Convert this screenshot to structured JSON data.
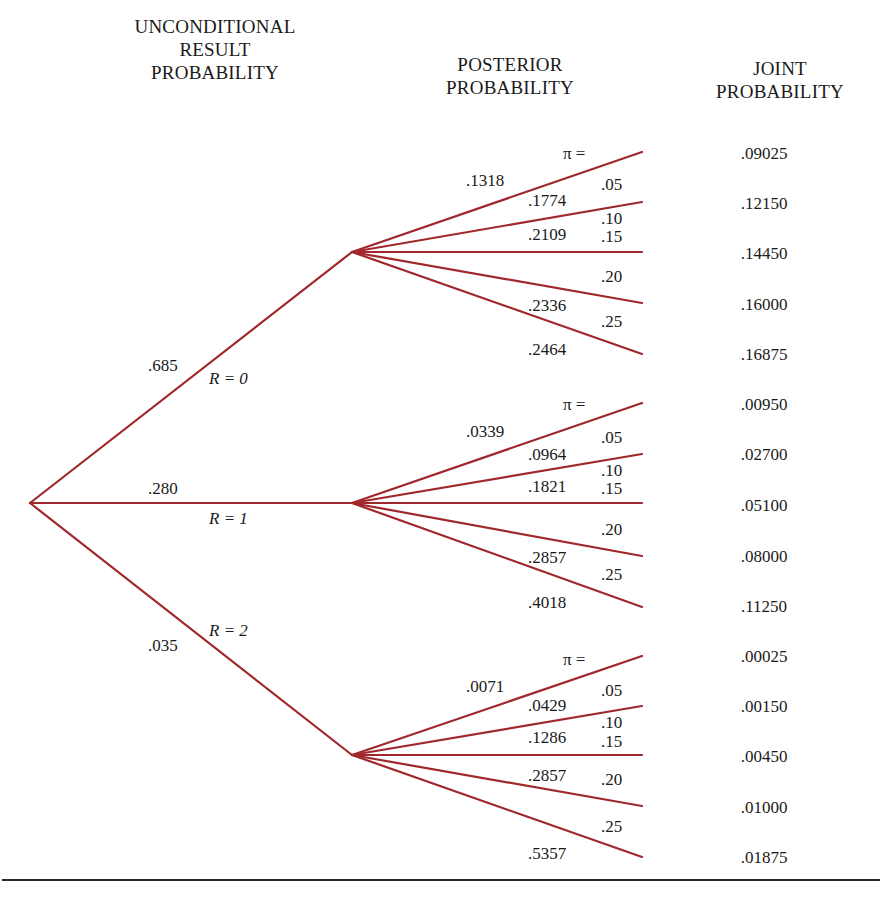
{
  "headers": {
    "unconditional": [
      "UNCONDITIONAL",
      "RESULT",
      "PROBABILITY"
    ],
    "posterior": [
      "POSTERIOR",
      "PROBABILITY"
    ],
    "joint": [
      "JOINT",
      "PROBABILITY"
    ]
  },
  "colors": {
    "branch": "#a0282c",
    "text": "#1a1a1a",
    "rule": "#2a2a2a"
  },
  "pi_label": "π =",
  "pi_values": [
    ".05",
    ".10",
    ".15",
    ".20",
    ".25"
  ],
  "results": [
    {
      "result_label": "R = 0",
      "unconditional_prob": ".685",
      "posterior": [
        ".1318",
        ".1774",
        ".2109",
        ".2336",
        ".2464"
      ],
      "joint": [
        ".09025",
        ".12150",
        ".14450",
        ".16000",
        ".16875"
      ]
    },
    {
      "result_label": "R = 1",
      "unconditional_prob": ".280",
      "posterior": [
        ".0339",
        ".0964",
        ".1821",
        ".2857",
        ".4018"
      ],
      "joint": [
        ".00950",
        ".02700",
        ".05100",
        ".08000",
        ".11250"
      ]
    },
    {
      "result_label": "R = 2",
      "unconditional_prob": ".035",
      "posterior": [
        ".0071",
        ".0429",
        ".1286",
        ".2857",
        ".5357"
      ],
      "joint": [
        ".00025",
        ".00150",
        ".00450",
        ".01000",
        ".01875"
      ]
    }
  ]
}
